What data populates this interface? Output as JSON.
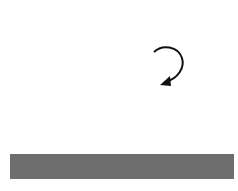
{
  "diagram": {
    "grid": {
      "x": 10,
      "y": 10,
      "cols": 10,
      "rows": 7,
      "cell_w": 22.4,
      "cell_h": 20.6,
      "line_color": "#b8b8b8"
    },
    "shape": {
      "type": "hexagon",
      "top_half_color": "#8c8c8c",
      "top_half_opacity": 0.8,
      "bottom_half_color": "#5e5e5e",
      "top_half_points": "99,38 144,38 163,72 81,72",
      "bottom_half_points": "81,72 163,72 144,107 99,107"
    },
    "arrow": {
      "name": "flip-arrow",
      "color": "#111111"
    },
    "label": "Flip",
    "bar_color": "#6e6e6e"
  }
}
